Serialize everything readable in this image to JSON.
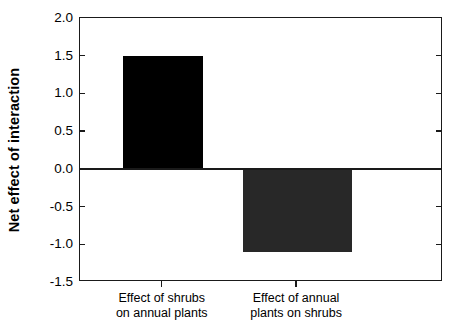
{
  "chart_data": {
    "type": "bar",
    "title": "",
    "xlabel": "",
    "ylabel": "Net effect of interaction",
    "categories": [
      "Effect of shrubs on annual plants",
      "Effect of annual plants on shrubs"
    ],
    "category_lines": [
      [
        "Effect of shrubs",
        "on annual plants"
      ],
      [
        "Effect of annual",
        "plants on shrubs"
      ]
    ],
    "values": [
      1.5,
      -1.1
    ],
    "ylim": [
      -1.5,
      2.0
    ],
    "ytick_labels": [
      "2.0",
      "1.5",
      "1.0",
      "0.5",
      "0.0",
      "-0.5",
      "-1.0",
      "-1.5"
    ],
    "ytick_values": [
      2.0,
      1.5,
      1.0,
      0.5,
      0.0,
      -0.5,
      -1.0,
      -1.5
    ],
    "grid": false,
    "legend": false,
    "bar_colors": [
      "#000000",
      "#282828"
    ],
    "axis_color": "#1a1a1a",
    "background": "#ffffff"
  }
}
